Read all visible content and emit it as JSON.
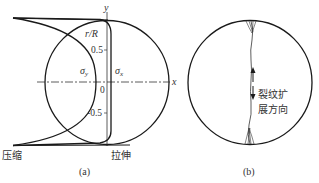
{
  "figure_a": {
    "caption": "(a)",
    "axis_y_label": "y",
    "axis_x_label": "x",
    "ratio_label": "r/R",
    "tick_top": "0.5",
    "tick_zero": "0",
    "tick_bottom": "-0.5",
    "stress_y_label": "σy",
    "stress_y_base": "σ",
    "stress_y_sub": "y",
    "stress_x_base": "σ",
    "stress_x_sub": "x",
    "compression_label": "压缩",
    "tension_label": "拉伸"
  },
  "figure_b": {
    "caption": "(b)",
    "crack_label_line1": "裂纹扩",
    "crack_label_line2": "展方向"
  },
  "colors": {
    "line": "#1a1a1a",
    "text": "#333333",
    "background": "#ffffff"
  }
}
